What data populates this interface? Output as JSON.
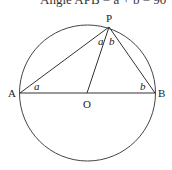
{
  "header": {
    "text": "Angle APB = a + b = 90°"
  },
  "diagram": {
    "points": {
      "A": {
        "label": "A",
        "x": 20,
        "y": 93
      },
      "B": {
        "label": "B",
        "x": 155,
        "y": 93
      },
      "O": {
        "label": "O",
        "x": 87,
        "y": 93
      },
      "P": {
        "label": "P",
        "x": 109,
        "y": 27
      }
    },
    "circle": {
      "cx": 87.5,
      "cy": 93,
      "r": 68
    },
    "angle_labels": {
      "at_A": "a",
      "at_B": "b",
      "at_P_left": "a",
      "at_P_right": "b"
    },
    "stroke_color": "#333333"
  }
}
